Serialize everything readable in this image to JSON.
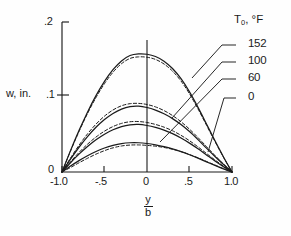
{
  "chart_data": {
    "type": "line",
    "title": "",
    "xlabel": "y/b",
    "ylabel": "w, in.",
    "xlim": [
      -1.0,
      1.0
    ],
    "ylim": [
      0,
      0.2
    ],
    "grid": false,
    "legend_position": "right",
    "legend_title": "T0, °F",
    "x_ticks": [
      -1.0,
      -0.5,
      0,
      0.5,
      1.0
    ],
    "x_tick_labels": [
      "-1.0",
      "-.5",
      "0",
      ".5",
      "1.0"
    ],
    "y_ticks": [
      0,
      0.1,
      0.2
    ],
    "y_tick_labels": [
      "0",
      ".1",
      ".2"
    ],
    "x": [
      -1.0,
      -0.9,
      -0.8,
      -0.7,
      -0.6,
      -0.5,
      -0.4,
      -0.3,
      -0.2,
      -0.1,
      0.0,
      0.1,
      0.2,
      0.3,
      0.4,
      0.5,
      0.6,
      0.7,
      0.8,
      0.9,
      1.0
    ],
    "series": [
      {
        "name": "152",
        "style": "solid",
        "peak": 0.157,
        "values": [
          0.0,
          0.0285,
          0.0552,
          0.0798,
          0.1018,
          0.1208,
          0.1364,
          0.1481,
          0.1553,
          0.1575,
          0.157,
          0.154,
          0.1478,
          0.138,
          0.1244,
          0.1068,
          0.0862,
          0.064,
          0.0416,
          0.0201,
          0.0
        ]
      },
      {
        "name": "152-dashed",
        "style": "dashed",
        "peak": 0.153,
        "values": [
          0.0,
          0.0278,
          0.0539,
          0.0779,
          0.0993,
          0.1178,
          0.133,
          0.1444,
          0.1514,
          0.1535,
          0.153,
          0.1501,
          0.144,
          0.1345,
          0.1213,
          0.1042,
          0.0841,
          0.0624,
          0.0406,
          0.0196,
          0.0
        ]
      },
      {
        "name": "100",
        "style": "solid",
        "peak": 0.086,
        "values": [
          0.0,
          0.0172,
          0.033,
          0.0472,
          0.0596,
          0.0699,
          0.0781,
          0.0839,
          0.0872,
          0.0878,
          0.086,
          0.0825,
          0.0776,
          0.0712,
          0.0633,
          0.0539,
          0.0432,
          0.0318,
          0.0206,
          0.0099,
          0.0
        ]
      },
      {
        "name": "100-dashed",
        "style": "dashed",
        "peak": 0.091,
        "values": [
          0.0,
          0.0186,
          0.0356,
          0.0508,
          0.0638,
          0.0745,
          0.0827,
          0.0883,
          0.0911,
          0.0915,
          0.09,
          0.0868,
          0.0819,
          0.0753,
          0.067,
          0.0571,
          0.0459,
          0.0339,
          0.022,
          0.0106,
          0.0
        ]
      },
      {
        "name": "60",
        "style": "solid",
        "peak": 0.062,
        "values": [
          0.0,
          0.0124,
          0.0238,
          0.034,
          0.0429,
          0.0504,
          0.0563,
          0.0605,
          0.0629,
          0.0634,
          0.062,
          0.0594,
          0.0558,
          0.0511,
          0.0453,
          0.0385,
          0.0309,
          0.0228,
          0.0147,
          0.0071,
          0.0
        ]
      },
      {
        "name": "60-dashed",
        "style": "dashed",
        "peak": 0.066,
        "values": [
          0.0,
          0.0136,
          0.026,
          0.0371,
          0.0466,
          0.0545,
          0.0606,
          0.0648,
          0.067,
          0.0673,
          0.066,
          0.0634,
          0.0598,
          0.055,
          0.0489,
          0.0417,
          0.0335,
          0.0247,
          0.016,
          0.0077,
          0.0
        ]
      },
      {
        "name": "0",
        "style": "solid",
        "peak": 0.038,
        "values": [
          0.0,
          0.0079,
          0.0152,
          0.0217,
          0.0273,
          0.032,
          0.0355,
          0.0379,
          0.039,
          0.039,
          0.038,
          0.0362,
          0.0338,
          0.0308,
          0.0272,
          0.023,
          0.0184,
          0.0136,
          0.0088,
          0.0042,
          0.0
        ]
      },
      {
        "name": "0-dashed",
        "style": "dashed",
        "peak": 0.035,
        "values": [
          0.0,
          0.006,
          0.0123,
          0.0183,
          0.0238,
          0.0285,
          0.0322,
          0.0347,
          0.0359,
          0.0361,
          0.0355,
          0.0344,
          0.0327,
          0.0303,
          0.0272,
          0.0233,
          0.0189,
          0.0141,
          0.0092,
          0.0044,
          0.0
        ]
      }
    ],
    "legend_entries": [
      {
        "label": "152",
        "value": 152
      },
      {
        "label": "100",
        "value": 100
      },
      {
        "label": "60",
        "value": 60
      },
      {
        "label": "0",
        "value": 0
      }
    ]
  },
  "axes": {
    "y_label": "w, in.",
    "y_tick_0": "0",
    "y_tick_1": ".1",
    "y_tick_2": ".2",
    "x_tick_neg1": "-1.0",
    "x_tick_neghalf": "-.5",
    "x_tick_zero": "0",
    "x_tick_half": ".5",
    "x_tick_one": "1.0",
    "x_label_num": "y",
    "x_label_den": "b"
  },
  "legend": {
    "header_main": "T",
    "header_sub": "0",
    "header_rest": ", °F",
    "item_152": "152",
    "item_100": "100",
    "item_60": "60",
    "item_0": "0"
  },
  "colors": {
    "ink": "#1b1b1b",
    "paper": "#fefefe"
  }
}
